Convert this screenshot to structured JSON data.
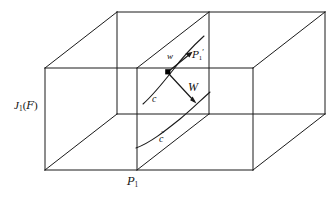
{
  "figure": {
    "kind": "geometry-diagram",
    "background_color": "#ffffff",
    "line_color": "#1a1a1a"
  },
  "labels": {
    "jet_bundle": {
      "base": "J",
      "subscript": "1",
      "open": "(",
      "script": "F",
      "close": ")"
    },
    "plane_front": {
      "script": "P",
      "subscript": "1"
    },
    "plane_inner": {
      "script": "P",
      "subscript": "1",
      "prime": "′"
    },
    "vector_lower": "w",
    "vector_upper": "W",
    "curve_upper": "c",
    "curve_lower": {
      "letter": "c",
      "accent": "̃"
    }
  },
  "geometry": {
    "point": {
      "x": 168,
      "y": 72
    },
    "arrows": [
      {
        "name": "w",
        "from": [
          168,
          72
        ],
        "to": [
          192,
          52
        ]
      },
      {
        "name": "W",
        "from": [
          168,
          72
        ],
        "to": [
          196,
          104
        ]
      }
    ],
    "box_outer": {
      "front_bottom_left": [
        45,
        170
      ],
      "front_bottom_right": [
        253,
        170
      ],
      "front_top_left": [
        45,
        68
      ],
      "front_top_right": [
        253,
        68
      ],
      "depth_dx": 72,
      "depth_dy": -56
    },
    "section_plane_x_front": 137,
    "section_plane_x_back": 209
  }
}
